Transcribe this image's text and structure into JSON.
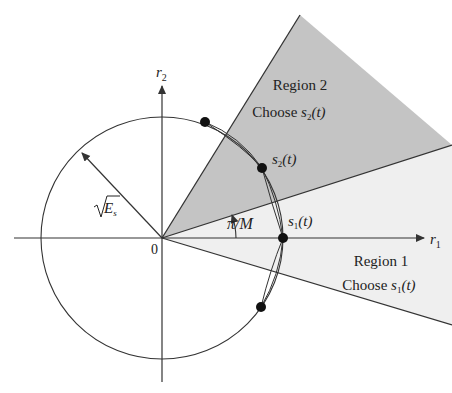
{
  "diagram": {
    "type": "M-PSK decision regions",
    "axes": {
      "horizontal_label": "r",
      "horizontal_sub": "1",
      "vertical_label": "r",
      "vertical_sub": "2",
      "origin_label": "0"
    },
    "radius_label": "E",
    "radius_sub": "s",
    "angle_label": "π/M",
    "signal_points": [
      {
        "label": "s",
        "sub": "1",
        "arg": "(t)"
      },
      {
        "label": "s",
        "sub": "2",
        "arg": "(t)"
      }
    ],
    "regions": [
      {
        "title": "Region 1",
        "choose": "Choose ",
        "sym": "s",
        "sub": "1",
        "arg": "(t)",
        "color": "#efefef"
      },
      {
        "title": "Region 2",
        "choose": "Choose ",
        "sym": "s",
        "sub": "2",
        "arg": "(t)",
        "color": "#c4c4c4"
      }
    ],
    "line_color": "#333333"
  }
}
